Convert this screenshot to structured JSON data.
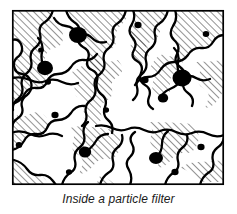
{
  "figure": {
    "caption": "Inside a particle filter",
    "alt_description": "Cross-section line drawing of a particle filter showing hatched fiber media with trapped black particles",
    "frame": {
      "x": 12,
      "y": 10,
      "width": 212,
      "height": 175,
      "stroke_color": "#000000",
      "stroke_width": 1.6,
      "fill_color": "#ffffff"
    },
    "style": {
      "line_color": "#000000",
      "fiber_stroke_width": 2.2,
      "hatch_color": "#000000",
      "hatch_stroke_width": 0.8,
      "hatch_angle_deg": 45,
      "hatch_spacing_px": 5,
      "particle_color": "#000000",
      "background_color": "#ffffff"
    },
    "fiber_regions": [
      {
        "name": "region-top-left",
        "path": "M12,10 L12,40 Q18,38 21,44 Q24,51 19,56 Q13,60 14,66 L14,84 Q22,82 25,75 Q28,66 35,66 Q43,66 45,58 Q47,49 54,48 Q62,47 63,39 Q64,30 58,26 Q51,22 53,14 L53,10 Z"
      },
      {
        "name": "region-top-center",
        "path": "M66,10 Q68,18 74,22 Q82,27 79,35 Q76,43 83,47 Q91,51 88,59 Q85,67 92,70 L98,74 Q104,70 103,62 Q102,53 109,50 Q117,47 116,39 Q115,30 121,25 Q128,20 126,12 L126,10 Z"
      },
      {
        "name": "region-top-right",
        "path": "M133,10 Q136,17 132,24 Q127,31 132,37 Q138,43 134,50 Q130,57 137,61 L144,64 Q150,59 148,51 Q146,43 153,40 Q161,37 160,29 Q159,21 165,16 L168,10 Z"
      },
      {
        "name": "region-right-top",
        "path": "M175,10 Q178,19 173,26 Q168,34 174,40 Q181,46 177,54 L174,62 Q183,62 188,55 Q193,47 201,48 Q209,49 213,42 Q217,35 224,35 L224,10 Z"
      },
      {
        "name": "region-mid-left",
        "path": "M12,72 L12,104 Q20,102 24,95 Q28,87 36,88 Q44,89 47,82 Q50,74 44,69 Q37,64 30,68 Q23,72 18,69 Z"
      },
      {
        "name": "region-center",
        "path": "M72,72 Q78,78 75,86 Q72,94 79,98 Q87,102 84,110 Q81,118 88,122 L96,126 Q103,121 101,113 Q99,105 106,101 Q114,97 112,89 Q110,81 117,77 Q124,73 122,66 L118,60 Q110,63 103,60 Q95,57 88,62 Q81,67 72,72 Z"
      },
      {
        "name": "region-mid-right",
        "path": "M150,68 Q156,74 153,82 Q150,90 157,94 L165,98 Q172,93 170,85 Q168,77 176,74 Q184,71 183,63 L180,56 Q172,58 165,55 Q158,52 150,68 Z"
      },
      {
        "name": "region-right-mid",
        "path": "M196,62 Q202,68 199,76 Q196,84 203,88 Q211,92 208,100 L205,108 Q213,107 218,100 Q223,93 224,86 L224,60 Q210,62 196,62 Z"
      },
      {
        "name": "region-bottom-left",
        "path": "M12,118 L12,150 Q20,148 24,141 Q28,133 36,134 Q44,135 47,128 Q50,120 44,115 Q37,110 30,114 Q23,118 18,115 Z"
      },
      {
        "name": "region-bottom-center",
        "path": "M70,128 Q76,134 73,142 Q70,150 77,154 Q85,158 82,166 L79,174 Q88,173 93,166 Q98,158 106,159 Q114,160 118,153 Q122,146 120,138 L116,130 Q100,128 85,126 Q76,126 70,128 Z"
      },
      {
        "name": "region-bottom-right",
        "path": "M148,122 Q154,128 151,136 Q148,144 155,148 Q163,152 160,160 L157,168 Q166,167 171,160 Q176,152 184,153 Q192,154 196,147 Q200,140 198,132 L194,124 Q170,122 148,122 Z"
      },
      {
        "name": "region-bottom-edge",
        "path": "M180,168 Q188,170 194,176 Q200,182 208,182 L224,182 L224,160 Q210,162 198,162 Q188,162 180,168 Z"
      }
    ],
    "fiber_outlines": [
      {
        "name": "fiber-outline-1",
        "path": "M12,40 Q18,38 21,44 Q24,51 19,56 Q13,60 14,66 Q15,73 22,74 Q29,75 31,82 Q33,90 27,95 Q20,100 22,107 Q24,114 18,118 Q12,122 12,128"
      },
      {
        "name": "fiber-outline-2",
        "path": "M53,10 Q51,18 45,22 Q38,26 40,34 Q42,42 36,47 Q29,52 31,60 Q33,68 27,73 Q20,78 22,86 Q24,94 18,99 Q12,103 13,110"
      },
      {
        "name": "fiber-outline-3",
        "path": "M66,10 Q68,18 74,22 Q82,27 79,35 Q76,43 83,47 Q91,51 88,59 Q85,67 92,70 Q99,73 97,81 Q95,89 101,94 Q108,99 105,107 Q102,115 108,120 Q114,125 112,133"
      },
      {
        "name": "fiber-outline-4",
        "path": "M126,10 Q124,19 118,23 Q111,27 113,35 Q115,43 109,48 Q102,53 104,61 Q106,69 100,74 Q93,79 95,87 Q97,95 91,100 Q84,105 86,113 Q88,121 82,126"
      },
      {
        "name": "fiber-outline-5",
        "path": "M133,10 Q136,17 132,24 Q127,31 132,37 Q138,43 134,50 Q130,57 137,61 Q144,65 141,73 Q138,81 145,85 Q152,89 149,97 Q146,105 153,109"
      },
      {
        "name": "fiber-outline-6",
        "path": "M168,10 Q166,19 160,23 Q153,27 155,35 Q157,43 151,48 Q144,53 146,61 Q148,69 142,74 Q135,79 137,87 Q139,95 133,100"
      },
      {
        "name": "fiber-outline-7",
        "path": "M175,10 Q178,19 173,26 Q168,34 174,40 Q181,46 177,54 Q173,62 180,67 Q187,72 184,80 Q181,88 188,93 Q195,98 192,106"
      },
      {
        "name": "fiber-outline-8",
        "path": "M224,35 Q217,35 213,42 Q209,49 201,48 Q193,47 188,55 Q183,62 174,62 Q166,62 161,69 Q156,77 148,77 Q140,77 135,85"
      },
      {
        "name": "fiber-outline-9",
        "path": "M12,104 Q20,102 24,95 Q28,87 36,88 Q44,89 47,82 Q50,74 58,74 Q66,74 71,67 Q76,59 84,60 Q92,61 97,54"
      },
      {
        "name": "fiber-outline-10",
        "path": "M12,150 Q20,148 24,141 Q28,133 36,134 Q44,135 47,128 Q50,120 58,120 Q66,120 71,113 Q76,105 84,106"
      },
      {
        "name": "fiber-outline-11",
        "path": "M14,160 Q22,162 27,169 Q32,176 40,175 Q48,174 53,181 L56,185"
      },
      {
        "name": "fiber-outline-12",
        "path": "M62,185 Q64,177 70,173 Q77,169 75,161 Q73,153 79,148 Q86,143 84,135 Q82,127 88,122"
      },
      {
        "name": "fiber-outline-13",
        "path": "M100,185 Q102,177 108,173 Q115,169 113,161 Q111,153 117,148 Q124,143 122,135"
      },
      {
        "name": "fiber-outline-14",
        "path": "M130,185 Q133,177 129,170 Q124,163 130,157 Q136,151 132,144 Q128,137 135,132"
      },
      {
        "name": "fiber-outline-15",
        "path": "M165,185 Q167,177 173,173 Q180,169 178,161 Q176,153 182,148 Q189,143 187,135"
      },
      {
        "name": "fiber-outline-16",
        "path": "M200,185 Q202,177 208,173 Q215,169 213,161 Q211,153 217,148 Q223,144 224,138"
      },
      {
        "name": "fiber-outline-17",
        "path": "M12,78 Q22,76 30,80 Q38,84 46,81 Q54,78 62,82 Q70,86 78,83"
      },
      {
        "name": "fiber-outline-18",
        "path": "M96,126 Q104,124 112,128 Q120,132 128,129 Q136,126 144,130 Q152,134 160,131"
      },
      {
        "name": "fiber-outline-19",
        "path": "M160,131 Q168,128 176,132 Q184,136 192,133 Q200,130 208,134 Q216,138 224,135"
      },
      {
        "name": "fiber-outline-20",
        "path": "M14,132 Q22,130 30,134 Q38,138 46,135 Q54,132 62,136"
      }
    ],
    "particles": [
      {
        "name": "particle-large-top",
        "cx": 78,
        "cy": 35,
        "r": 8.5,
        "size": "large"
      },
      {
        "name": "particle-large-left",
        "cx": 45,
        "cy": 68,
        "r": 7.5,
        "size": "large"
      },
      {
        "name": "particle-large-right",
        "cx": 182,
        "cy": 78,
        "r": 9.0,
        "size": "large"
      },
      {
        "name": "particle-medium-bottom-center",
        "cx": 85,
        "cy": 152,
        "r": 6.0,
        "size": "medium"
      },
      {
        "name": "particle-medium-bottom-right",
        "cx": 156,
        "cy": 158,
        "r": 6.5,
        "size": "medium"
      },
      {
        "name": "particle-medium-center",
        "cx": 163,
        "cy": 98,
        "r": 5.0,
        "size": "medium"
      },
      {
        "name": "particle-small-center",
        "cx": 145,
        "cy": 80,
        "r": 3.5,
        "size": "small"
      },
      {
        "name": "particle-small-top-center",
        "cx": 138,
        "cy": 25,
        "r": 3.5,
        "size": "small"
      },
      {
        "name": "particle-small-top-right",
        "cx": 206,
        "cy": 34,
        "r": 3.2,
        "size": "small"
      },
      {
        "name": "particle-small-mid-left",
        "cx": 55,
        "cy": 115,
        "r": 3.5,
        "size": "small"
      },
      {
        "name": "particle-small-left-low",
        "cx": 19,
        "cy": 145,
        "r": 3.2,
        "size": "small"
      },
      {
        "name": "particle-small-left-upper",
        "cx": 48,
        "cy": 82,
        "r": 3.0,
        "size": "small"
      },
      {
        "name": "particle-small-bottom-left",
        "cx": 69,
        "cy": 172,
        "r": 3.0,
        "size": "small"
      },
      {
        "name": "particle-small-bottom-mid",
        "cx": 175,
        "cy": 172,
        "r": 3.5,
        "size": "small"
      },
      {
        "name": "particle-small-right-low",
        "cx": 201,
        "cy": 147,
        "r": 3.5,
        "size": "small"
      },
      {
        "name": "particle-small-mid-center",
        "cx": 106,
        "cy": 110,
        "r": 3.0,
        "size": "small"
      },
      {
        "name": "particle-small-upper-left",
        "cx": 41,
        "cy": 50,
        "r": 2.8,
        "size": "small"
      }
    ]
  }
}
